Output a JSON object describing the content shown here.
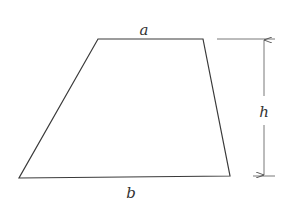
{
  "diagram": {
    "labels": {
      "top_side": "a",
      "bottom_side": "b",
      "height": "h"
    },
    "stroke_color": "#3a3a3a",
    "vertices": {
      "top_left": [
        98,
        39
      ],
      "top_right": [
        203,
        39
      ],
      "bottom_right": [
        230,
        176
      ],
      "bottom_left": [
        19,
        178
      ]
    }
  }
}
